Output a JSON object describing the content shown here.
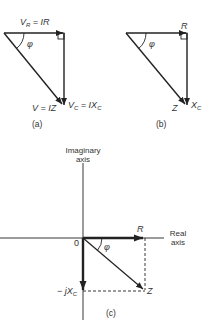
{
  "diagram": {
    "panels": [
      {
        "id": "a",
        "caption": "(a)",
        "type": "voltage-triangle",
        "labels": {
          "top": "V_R = IR",
          "top_parts": {
            "main": "V",
            "sub": "R",
            "rest": " = IR"
          },
          "angle": "φ",
          "hypotenuse": "V = IZ",
          "vertical": "V_C = IX_C",
          "vertical_parts": {
            "main": "V",
            "sub": "C",
            "mid": " = IX",
            "sub2": "C"
          }
        }
      },
      {
        "id": "b",
        "caption": "(b)",
        "type": "impedance-triangle",
        "labels": {
          "top": "R",
          "angle": "φ",
          "hypotenuse": "Z",
          "vertical": "X_C",
          "vertical_parts": {
            "main": "X",
            "sub": "C"
          }
        }
      },
      {
        "id": "c",
        "caption": "(c)",
        "type": "complex-plane",
        "labels": {
          "imag_axis_line1": "Imaginary",
          "imag_axis_line2": "axis",
          "real_axis_line1": "Real",
          "real_axis_line2": "axis",
          "origin": "0",
          "r_vector": "R",
          "angle": "φ",
          "z_vector": "Z",
          "neg_jxc": "− jX_C",
          "neg_jxc_parts": {
            "prefix": "− j",
            "main": "X",
            "sub": "C"
          }
        }
      }
    ],
    "colors": {
      "line": "#222222",
      "text": "#333333",
      "background": "#ffffff"
    }
  }
}
